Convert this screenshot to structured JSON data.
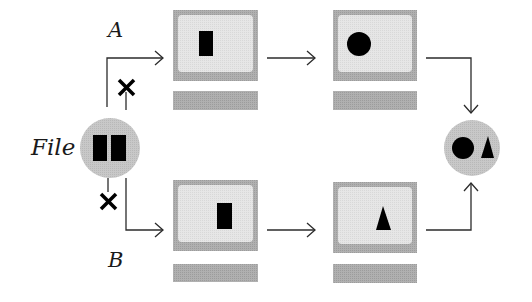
{
  "diagram": {
    "labels": {
      "path_a": "A",
      "path_b": "B",
      "source": "File"
    },
    "colors": {
      "background": "#ffffff",
      "monitor_frame": "#a9a9a9",
      "monitor_screen": "#e2e2e2",
      "monitor_base": "#a6a6a6",
      "node_circle": "#c4c4c4",
      "glyph": "#000000",
      "line": "#2b2b2b"
    },
    "nodes": [
      {
        "id": "file",
        "type": "circle",
        "content": "two-blocks",
        "label": "File"
      },
      {
        "id": "a1",
        "type": "monitor",
        "path": "A",
        "content": "rectangle-left"
      },
      {
        "id": "a2",
        "type": "monitor",
        "path": "A",
        "content": "circle"
      },
      {
        "id": "b1",
        "type": "monitor",
        "path": "B",
        "content": "rectangle-right"
      },
      {
        "id": "b2",
        "type": "monitor",
        "path": "B",
        "content": "triangle"
      },
      {
        "id": "result",
        "type": "circle",
        "content": "circle-and-triangle"
      }
    ],
    "edges": [
      {
        "from": "file",
        "to": "a1",
        "blocked_branch": true
      },
      {
        "from": "a1",
        "to": "a2"
      },
      {
        "from": "a2",
        "to": "result"
      },
      {
        "from": "file",
        "to": "b1",
        "blocked_branch": true
      },
      {
        "from": "b1",
        "to": "b2"
      },
      {
        "from": "b2",
        "to": "result"
      }
    ],
    "icons": {
      "blocked": "x-mark-icon",
      "arrow": "arrow-icon"
    }
  }
}
